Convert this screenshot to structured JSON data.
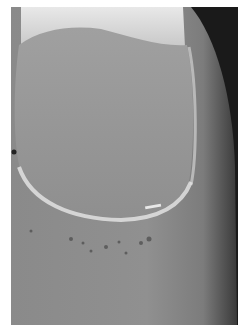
{
  "image": {
    "subject": "close-up photograph of a fingernail",
    "colors": {
      "background": "#ffffff",
      "dark_edge": "#1a1a1a",
      "skin": "#8e8e8e",
      "nail_plate": "#9a9a9a",
      "free_edge": "#d8d8d8",
      "cuticle": "#e6e6e6"
    }
  }
}
